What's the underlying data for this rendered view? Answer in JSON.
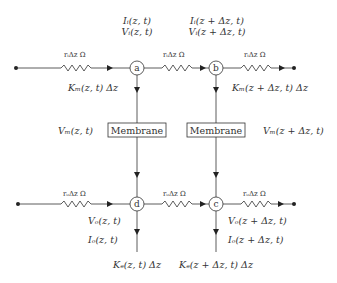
{
  "diagram": {
    "type": "circuit-cable-model",
    "colors": {
      "line": "#333333",
      "text": "#333333",
      "background": "#ffffff"
    },
    "nodes": [
      {
        "id": "a",
        "label": "a"
      },
      {
        "id": "b",
        "label": "b"
      },
      {
        "id": "c",
        "label": "c"
      },
      {
        "id": "d",
        "label": "d"
      }
    ],
    "resistors": {
      "inner_left": "rᵢΔz Ω",
      "inner_mid": "rᵢΔz Ω",
      "inner_right": "rᵢΔz Ω",
      "outer_left": "rₒΔz Ω",
      "outer_mid": "rₒΔz Ω",
      "outer_right": "rₒΔz Ω"
    },
    "membranes": [
      {
        "label": "Membrane"
      },
      {
        "label": "Membrane"
      }
    ],
    "labels": {
      "Ii_a": "Iᵢ(z, t)",
      "Vi_a": "Vᵢ(z, t)",
      "Ii_b": "Iᵢ(z + Δz, t)",
      "Vi_b": "Vᵢ(z + Δz, t)",
      "Km_a": "Kₘ(z, t) Δz",
      "Km_b": "Kₘ(z + Δz, t) Δz",
      "Vm_left": "Vₘ(z, t)",
      "Vm_right": "Vₘ(z + Δz, t)",
      "Vo_d": "Vₒ(z, t)",
      "Io_d": "Iₒ(z, t)",
      "Ke_d": "Kₑ(z, t) Δz",
      "Vo_c": "Vₒ(z + Δz, t)",
      "Io_c": "Iₒ(z + Δz, t)",
      "Ke_c": "Kₑ(z + Δz, t) Δz"
    }
  }
}
